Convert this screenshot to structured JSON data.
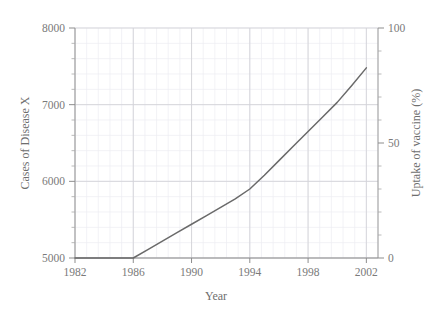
{
  "chart_data": {
    "type": "line",
    "title": "",
    "xlabel": "Year",
    "ylabel": "Cases of Disease X",
    "ylabel_right": "Uptake of vaccine (%)",
    "xlim": [
      1982,
      2002.8
    ],
    "ylim": [
      5000,
      8000
    ],
    "ylim_right": [
      0,
      100
    ],
    "grid": true,
    "minor_grid": true,
    "legend": "none",
    "x_ticks": [
      1982,
      1986,
      1990,
      1994,
      1998,
      2002
    ],
    "x_tick_labels": [
      "1982",
      "1986",
      "1990",
      "1994",
      "1998",
      "2002"
    ],
    "y_ticks": [
      5000,
      6000,
      7000,
      8000
    ],
    "y_tick_labels": [
      "5000",
      "6000",
      "7000",
      "8000"
    ],
    "y_ticks_right": [
      0,
      50,
      100
    ],
    "y_tick_labels_right": [
      "0",
      "50",
      "100"
    ],
    "series": [
      {
        "name": "Uptake of vaccine",
        "color": "#6a6a6a",
        "x": [
          1982,
          1983,
          1984,
          1985,
          1986,
          1987,
          1988,
          1989,
          1990,
          1991,
          1992,
          1993,
          1994,
          1995,
          1996,
          1997,
          1998,
          1999,
          2000,
          2001,
          2002
        ],
        "values": [
          5000,
          5000,
          5000,
          5000,
          5000,
          5110,
          5220,
          5330,
          5440,
          5550,
          5660,
          5770,
          5900,
          6080,
          6270,
          6460,
          6650,
          6840,
          7030,
          7250,
          7480
        ],
        "values_right_axis": [
          0,
          0,
          0,
          0,
          0,
          3.7,
          7.3,
          11.0,
          14.7,
          18.3,
          22.0,
          25.7,
          30.0,
          36.0,
          42.3,
          48.7,
          55.0,
          61.3,
          67.7,
          75.0,
          82.7
        ]
      }
    ]
  },
  "axes": {
    "left_title": "Cases of Disease X",
    "right_title": "Uptake of vaccine (%)",
    "bottom_title": "Year"
  }
}
